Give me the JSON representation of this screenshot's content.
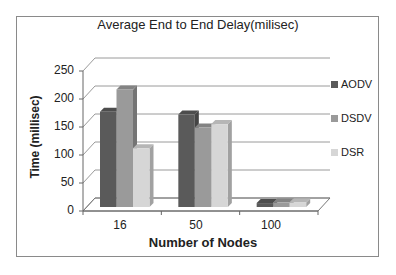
{
  "chart_data": {
    "type": "bar",
    "title": "Average End to End Delay(milisec)",
    "xlabel": "Number of Nodes",
    "ylabel": "Time (millisec)",
    "categories": [
      "16",
      "50",
      "100"
    ],
    "series": [
      {
        "name": "AODV",
        "values": [
          170,
          165,
          7
        ],
        "color": "#5a5a5a"
      },
      {
        "name": "DSDV",
        "values": [
          210,
          142,
          8
        ],
        "color": "#9a9a9a"
      },
      {
        "name": "DSR",
        "values": [
          105,
          148,
          8
        ],
        "color": "#d6d6d6"
      }
    ],
    "ylim": [
      0,
      250
    ],
    "yticks": [
      0,
      50,
      100,
      150,
      200,
      250
    ],
    "grid": true,
    "legend_position": "right",
    "style": "3d-clustered-column"
  },
  "title": "Average End to End Delay(milisec)",
  "xlabel": "Number of Nodes",
  "ylabel": "Time (millisec)",
  "yticks": [
    "250",
    "200",
    "150",
    "100",
    "50",
    "0"
  ],
  "xticks": [
    "16",
    "50",
    "100"
  ],
  "legend": [
    {
      "label": "AODV",
      "color": "#5a5a5a"
    },
    {
      "label": "DSDV",
      "color": "#9a9a9a"
    },
    {
      "label": "DSR",
      "color": "#d6d6d6"
    }
  ]
}
